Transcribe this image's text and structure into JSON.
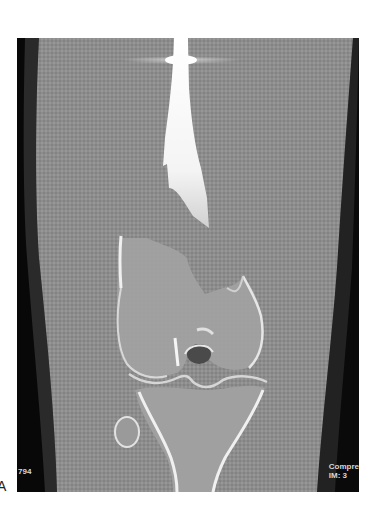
{
  "figure": {
    "panel_label": "A"
  },
  "scan": {
    "overlay_bottom_left": "794",
    "overlay_bottom_right_line1": "Compre",
    "overlay_bottom_right_line2": "IM: 3",
    "colors": {
      "background": "#0c0c0c",
      "soft_tissue": "#8e8e8e",
      "bone_cortex": "#f2f2f2",
      "bone_marrow": "#a8a8a8"
    }
  }
}
